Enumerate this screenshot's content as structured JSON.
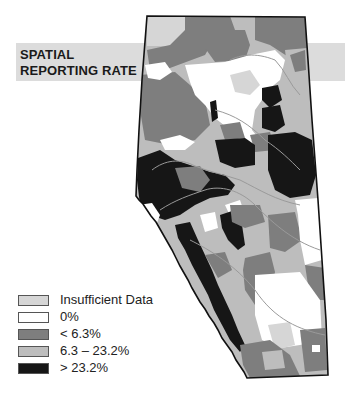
{
  "title": {
    "line1": "SPATIAL",
    "line2": "REPORTING RATE"
  },
  "legend": {
    "items": [
      {
        "label": "Insufficient Data",
        "color": "#d6d6d6"
      },
      {
        "label": "0%",
        "color": "#ffffff"
      },
      {
        "label": "< 6.3%",
        "color": "#7e7e7e"
      },
      {
        "label": "6.3 – 23.2%",
        "color": "#bdbdbd"
      },
      {
        "label": "> 23.2%",
        "color": "#161616"
      }
    ]
  },
  "map": {
    "region": "Alberta",
    "colors": {
      "insufficient": "#d6d6d6",
      "zero": "#ffffff",
      "low": "#7e7e7e",
      "mid": "#bdbdbd",
      "high": "#161616",
      "outline": "#111111",
      "rivers": "#9a9a9a"
    }
  }
}
